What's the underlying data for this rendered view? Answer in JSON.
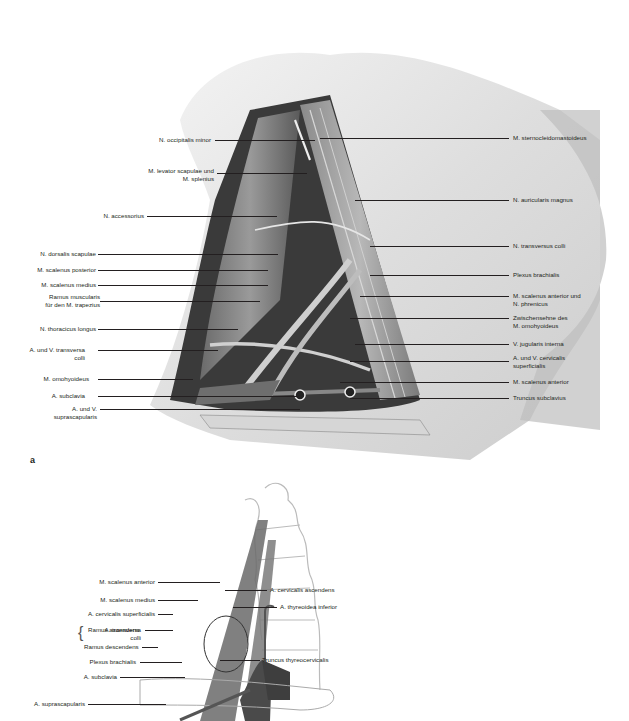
{
  "figure_a": {
    "panel_letter": "a",
    "left_labels": [
      {
        "text": "N. occipitalis minor",
        "lines": [
          "N. occipitalis minor"
        ]
      },
      {
        "text": "M. levator scapulae und M. splenius",
        "lines": [
          "M. levator scapulae und",
          "M. splenius"
        ]
      },
      {
        "text": "N. accessorius",
        "lines": [
          "N. accessorius"
        ]
      },
      {
        "text": "N. dorsalis scapulae",
        "lines": [
          "N. dorsalis scapulae"
        ]
      },
      {
        "text": "M. scalenus posterior",
        "lines": [
          "M. scalenus posterior"
        ]
      },
      {
        "text": "M. scalenus medius",
        "lines": [
          "M. scalenus medius"
        ]
      },
      {
        "text": "Ramus muscularis für den M. trapezius",
        "lines": [
          "Ramus muscularis",
          "für den M. trapezius"
        ]
      },
      {
        "text": "N. thoracicus longus",
        "lines": [
          "N. thoracicus longus"
        ]
      },
      {
        "text": "A. und V. transversa colli",
        "lines": [
          "A. und V. transversa",
          "colli"
        ]
      },
      {
        "text": "M. omohyoideus",
        "lines": [
          "M. omohyoideus"
        ]
      },
      {
        "text": "A. subclavia",
        "lines": [
          "A. subclavia"
        ]
      },
      {
        "text": "A. und V. suprascapularis",
        "lines": [
          "A. und V.",
          "suprascapularis"
        ]
      }
    ],
    "right_labels": [
      {
        "text": "M. sternocleidomastoideus",
        "lines": [
          "M. sternocleidomastoideus"
        ]
      },
      {
        "text": "N. auricularis magnus",
        "lines": [
          "N. auricularis magnus"
        ]
      },
      {
        "text": "N. transversus colli",
        "lines": [
          "N. transversus colli"
        ]
      },
      {
        "text": "Plexus brachialis",
        "lines": [
          "Plexus brachialis"
        ]
      },
      {
        "text": "M. scalenus anterior und N. phrenicus",
        "lines": [
          "M. scalenus anterior und",
          "N. phrenicus"
        ]
      },
      {
        "text": "Zwischensehne des M. omohyoideus",
        "lines": [
          "Zwischensehne des",
          "M. omohyoideus"
        ]
      },
      {
        "text": "V. jugularis interna",
        "lines": [
          "V. jugularis interna"
        ]
      },
      {
        "text": "A. und V. cervicalis superficialis",
        "lines": [
          "A. und V. cervicalis",
          "superficialis"
        ]
      },
      {
        "text": "M. scalenus anterior",
        "lines": [
          "M. scalenus anterior"
        ]
      },
      {
        "text": "Truncus subclavius",
        "lines": [
          "Truncus subclavius"
        ]
      }
    ]
  },
  "figure_b": {
    "left_labels": [
      {
        "lines": [
          "M. scalenus anterior"
        ]
      },
      {
        "lines": [
          "M. scalenus medius"
        ]
      },
      {
        "lines": [
          "A. cervicalis superficialis"
        ]
      },
      {
        "lines": [
          "Ramus ascendens"
        ]
      },
      {
        "lines": [
          "Ramus descendens"
        ]
      },
      {
        "lines": [
          "Plexus brachialis"
        ]
      },
      {
        "lines": [
          "A. subclavia"
        ]
      },
      {
        "lines": [
          "A. suprascapularis"
        ]
      }
    ],
    "group_label": {
      "lines": [
        "A. transversa",
        "colli"
      ]
    },
    "right_labels": [
      {
        "lines": [
          "A. cervicalis ascendens"
        ]
      },
      {
        "lines": [
          "A. thyreoidea inferior"
        ]
      },
      {
        "lines": [
          "Truncus thyreocervicalis"
        ]
      }
    ]
  }
}
